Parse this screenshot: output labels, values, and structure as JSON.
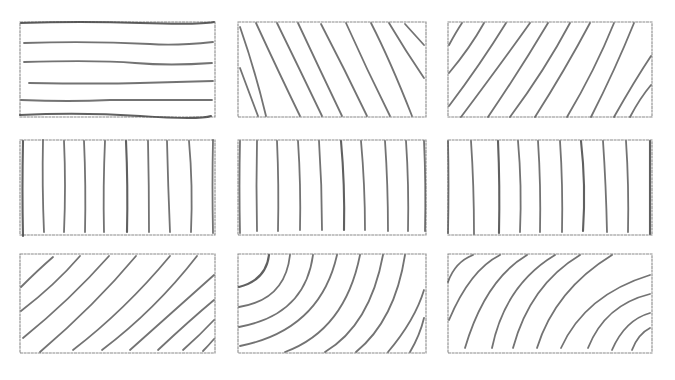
{
  "sheet": {
    "description": "Hand-drawn pencil sketch sheet of nine wood-grain hatching patterns",
    "background": "#ffffff",
    "pencil_color": "#5a5a5a",
    "frame_color": "#8a8a8a"
  },
  "panels": [
    {
      "id": "p1",
      "row": 1,
      "col": 1,
      "pattern": "horizontal-lines",
      "x": 20,
      "y": 22,
      "w": 195,
      "h": 95
    },
    {
      "id": "p2",
      "row": 1,
      "col": 2,
      "pattern": "diagonal-descending",
      "x": 238,
      "y": 22,
      "w": 188,
      "h": 95
    },
    {
      "id": "p3",
      "row": 1,
      "col": 3,
      "pattern": "diagonal-ascending-curved",
      "x": 448,
      "y": 22,
      "w": 204,
      "h": 95
    },
    {
      "id": "p4",
      "row": 2,
      "col": 1,
      "pattern": "vertical-lines",
      "x": 20,
      "y": 140,
      "w": 195,
      "h": 95
    },
    {
      "id": "p5",
      "row": 2,
      "col": 2,
      "pattern": "vertical-lines",
      "x": 238,
      "y": 140,
      "w": 188,
      "h": 95
    },
    {
      "id": "p6",
      "row": 2,
      "col": 3,
      "pattern": "vertical-lines",
      "x": 448,
      "y": 140,
      "w": 204,
      "h": 95
    },
    {
      "id": "p7",
      "row": 3,
      "col": 1,
      "pattern": "diagonal-ascending",
      "x": 20,
      "y": 254,
      "w": 195,
      "h": 99
    },
    {
      "id": "p8",
      "row": 3,
      "col": 2,
      "pattern": "concentric-arcs-top-left",
      "x": 238,
      "y": 254,
      "w": 188,
      "h": 99
    },
    {
      "id": "p9",
      "row": 3,
      "col": 3,
      "pattern": "concentric-arcs-bottom-right",
      "x": 448,
      "y": 254,
      "w": 204,
      "h": 99
    }
  ]
}
